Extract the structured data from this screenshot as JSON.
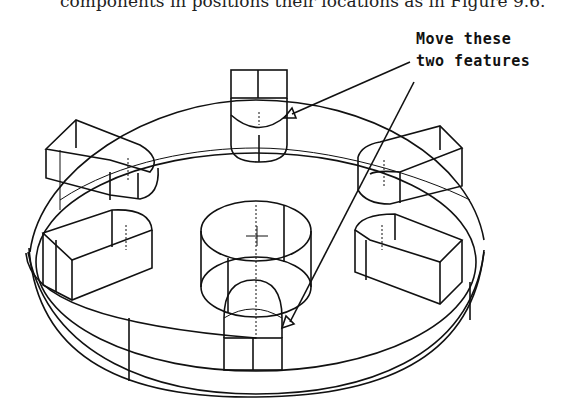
{
  "figure": {
    "top_text": "components in positions their locations as in Figure 9.6.",
    "annotation": {
      "line1": "Move these",
      "line2": "two features"
    }
  }
}
